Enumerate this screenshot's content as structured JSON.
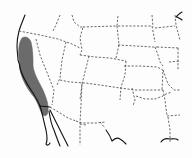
{
  "map": {
    "type": "species-range-map",
    "region": "Western United States",
    "range_fill_color": "#6b6b6b",
    "border_color": "#444444",
    "coast_color": "#111111",
    "background_color": "#fdfdfd",
    "range_description": "Shaded distribution along the Pacific coast of California and southwest Oregon"
  }
}
